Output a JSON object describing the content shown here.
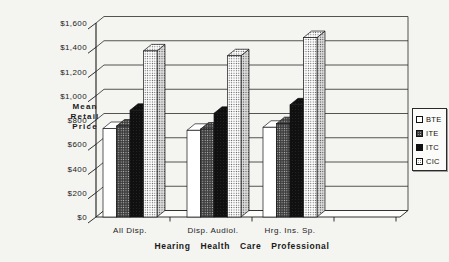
{
  "chart_data": {
    "type": "bar",
    "projection": "3d",
    "title": "",
    "categories": [
      "All Disp.",
      "Disp. Audiol.",
      "Hrg. Ins. Sp."
    ],
    "series": [
      {
        "name": "BTE",
        "pattern": "white",
        "values": [
          730,
          715,
          740
        ]
      },
      {
        "name": "ITE",
        "pattern": "dark-dither",
        "values": [
          750,
          725,
          770
        ]
      },
      {
        "name": "ITC",
        "pattern": "black",
        "values": [
          880,
          855,
          925
        ]
      },
      {
        "name": "CIC",
        "pattern": "light-stipple",
        "values": [
          1370,
          1330,
          1480
        ]
      }
    ],
    "ylabel": "Mean Retail Price",
    "ylabel_lines": [
      "Mean",
      "Retail",
      "Price"
    ],
    "xlabel": "Hearing Health Care Professional",
    "ylim": [
      0,
      1600
    ],
    "ytick_step": 200,
    "ytick_labels": [
      "$0",
      "$200",
      "$400",
      "$600",
      "$800",
      "$1,000",
      "$1,200",
      "$1,400",
      "$1,600"
    ],
    "legend_position": "right",
    "grid": true,
    "colors": {
      "axis": "#1c1c1c",
      "grid": "#2a2a2a",
      "wall": "#fbfbf9",
      "bar_outline": "#161616",
      "dark_fill": "#3d3d3d",
      "black_fill": "#101010"
    }
  }
}
